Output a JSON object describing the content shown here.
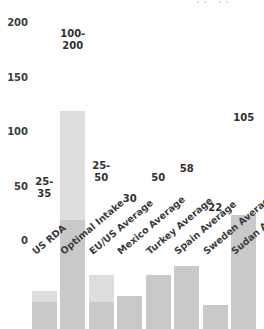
{
  "chart_data": {
    "type": "bar",
    "title": "",
    "xlabel": "",
    "ylabel": "",
    "ylim": [
      0,
      200
    ],
    "yticks": [
      0,
      50,
      100,
      150,
      200
    ],
    "grid": false,
    "legend": null,
    "categories": [
      "US RDA",
      "Optimal Intake",
      "EU/US Average",
      "Mexico Average",
      "Turkey Average",
      "Spain Average",
      "Sweden Average",
      "Sudan Average"
    ],
    "values": [
      35,
      200,
      50,
      30,
      50,
      58,
      22,
      105
    ],
    "bars": [
      {
        "category": "US RDA",
        "low": 25,
        "high": 35,
        "value": 35,
        "is_range": true,
        "label": "25-\n35",
        "label_inside": false
      },
      {
        "category": "Optimal Intake",
        "low": 100,
        "high": 200,
        "value": 200,
        "is_range": true,
        "label": "100-\n200",
        "label_inside": true
      },
      {
        "category": "EU/US Average",
        "low": 25,
        "high": 50,
        "value": 50,
        "is_range": true,
        "label": "25-\n50",
        "label_inside": false
      },
      {
        "category": "Mexico Average",
        "low": 0,
        "high": 30,
        "value": 30,
        "is_range": false,
        "label": "30",
        "label_inside": false
      },
      {
        "category": "Turkey Average",
        "low": 0,
        "high": 50,
        "value": 50,
        "is_range": false,
        "label": "50",
        "label_inside": false
      },
      {
        "category": "Spain Average",
        "low": 0,
        "high": 58,
        "value": 58,
        "is_range": false,
        "label": "58",
        "label_inside": false
      },
      {
        "category": "Sweden Average",
        "low": 0,
        "high": 22,
        "value": 22,
        "is_range": false,
        "label": "22",
        "label_inside": false
      },
      {
        "category": "Sudan Average",
        "low": 0,
        "high": 105,
        "value": 105,
        "is_range": false,
        "label": "105",
        "label_inside": false
      }
    ],
    "colors": {
      "bar_solid": "#c9c9c9",
      "bar_range_upper": "#dedede",
      "background": "#ffffff",
      "text": "#3b3b3b"
    }
  },
  "title_remnant": "··  ··"
}
